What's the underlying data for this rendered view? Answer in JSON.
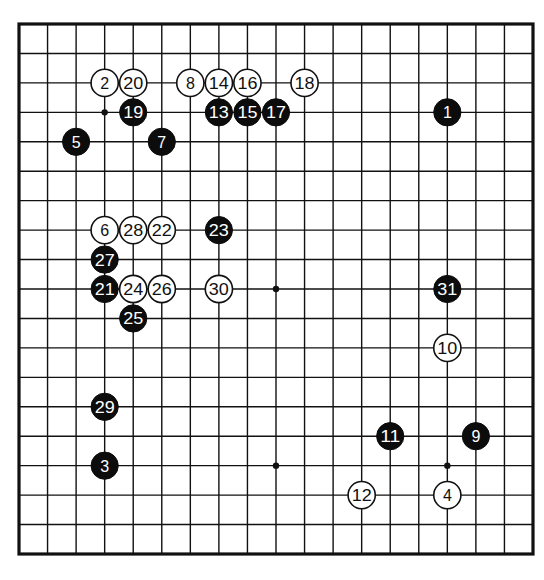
{
  "diagram": {
    "type": "go-game-record",
    "board_size": 19,
    "colors": {
      "background": "#ffffff",
      "lines": "#111111",
      "black_stone": "#0c0c0c",
      "white_stone": "#ffffff"
    },
    "hoshi_visible": [
      [
        3,
        3
      ],
      [
        9,
        9
      ],
      [
        9,
        15
      ],
      [
        15,
        15
      ]
    ],
    "stones": [
      {
        "move": "1",
        "color": "black",
        "col": 15,
        "row": 3
      },
      {
        "move": "2",
        "color": "white",
        "col": 3,
        "row": 2
      },
      {
        "move": "3",
        "color": "black",
        "col": 3,
        "row": 15
      },
      {
        "move": "4",
        "color": "white",
        "col": 15,
        "row": 16
      },
      {
        "move": "5",
        "color": "black",
        "col": 2,
        "row": 4
      },
      {
        "move": "6",
        "color": "white",
        "col": 3,
        "row": 7
      },
      {
        "move": "7",
        "color": "black",
        "col": 5,
        "row": 4
      },
      {
        "move": "8",
        "color": "white",
        "col": 6,
        "row": 2
      },
      {
        "move": "9",
        "color": "black",
        "col": 16,
        "row": 14
      },
      {
        "move": "10",
        "color": "white",
        "col": 15,
        "row": 11
      },
      {
        "move": "11",
        "color": "black",
        "col": 13,
        "row": 14
      },
      {
        "move": "12",
        "color": "white",
        "col": 12,
        "row": 16
      },
      {
        "move": "13",
        "color": "black",
        "col": 7,
        "row": 3
      },
      {
        "move": "14",
        "color": "white",
        "col": 7,
        "row": 2
      },
      {
        "move": "15",
        "color": "black",
        "col": 8,
        "row": 3
      },
      {
        "move": "16",
        "color": "white",
        "col": 8,
        "row": 2
      },
      {
        "move": "17",
        "color": "black",
        "col": 9,
        "row": 3
      },
      {
        "move": "18",
        "color": "white",
        "col": 10,
        "row": 2
      },
      {
        "move": "19",
        "color": "black",
        "col": 4,
        "row": 3
      },
      {
        "move": "20",
        "color": "white",
        "col": 4,
        "row": 2
      },
      {
        "move": "21",
        "color": "black",
        "col": 3,
        "row": 9
      },
      {
        "move": "22",
        "color": "white",
        "col": 5,
        "row": 7
      },
      {
        "move": "23",
        "color": "black",
        "col": 7,
        "row": 7
      },
      {
        "move": "24",
        "color": "white",
        "col": 4,
        "row": 9
      },
      {
        "move": "25",
        "color": "black",
        "col": 4,
        "row": 10
      },
      {
        "move": "26",
        "color": "white",
        "col": 5,
        "row": 9
      },
      {
        "move": "27",
        "color": "black",
        "col": 3,
        "row": 8
      },
      {
        "move": "28",
        "color": "white",
        "col": 4,
        "row": 7
      },
      {
        "move": "29",
        "color": "black",
        "col": 3,
        "row": 13
      },
      {
        "move": "30",
        "color": "white",
        "col": 7,
        "row": 9
      },
      {
        "move": "31",
        "color": "black",
        "col": 15,
        "row": 9
      }
    ]
  }
}
